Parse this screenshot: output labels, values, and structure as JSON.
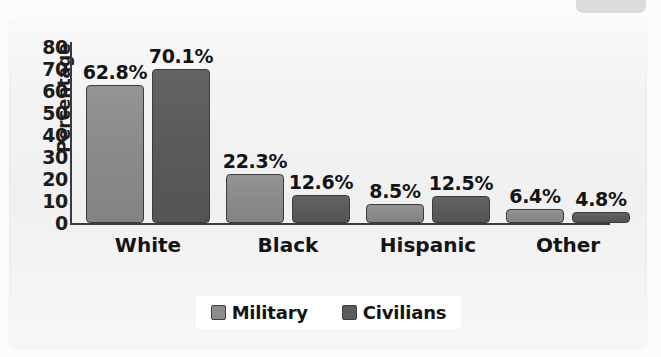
{
  "chart_data": {
    "type": "bar",
    "title": "",
    "xlabel": "",
    "ylabel": "Percentage",
    "ylim": [
      0,
      80
    ],
    "yticks": [
      "80",
      "70",
      "60",
      "50",
      "40",
      "30",
      "20",
      "10",
      "0"
    ],
    "grid": false,
    "legend_position": "bottom",
    "categories": [
      "White",
      "Black",
      "Hispanic",
      "Other"
    ],
    "series": [
      {
        "name": "Military",
        "color": "#8b8b8b",
        "values": [
          62.8,
          22.3,
          8.5,
          6.4
        ],
        "labels": [
          "62.8%",
          "22.3%",
          "8.5%",
          "6.4%"
        ]
      },
      {
        "name": "Civilians",
        "color": "#5b5b5b",
        "values": [
          70.1,
          12.6,
          12.5,
          4.8
        ],
        "labels": [
          "70.1%",
          "12.6%",
          "12.5%",
          "4.8%"
        ]
      }
    ]
  },
  "colors": {
    "panel_background": "#f3f3f3",
    "page_background": "#fbfbfb",
    "axis": "#3b3b3b",
    "text": "#141414",
    "military": "#8b8b8b",
    "civilians": "#5b5b5b",
    "legend_background": "#ffffff"
  }
}
